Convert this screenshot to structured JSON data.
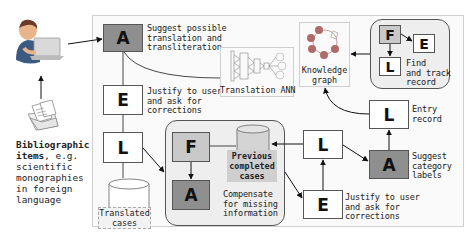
{
  "actor": {
    "icon": "user-with-laptop-icon",
    "documents_icon": "documents-folder-icon",
    "caption_bold": "Bibliographic\nitems",
    "caption_rest": ", e.g.\nscientific\nmonographies\nin foreign\nlanguage"
  },
  "left_column": {
    "node_a": {
      "letter": "A",
      "label": "Suggest possible\ntranslation and\ntransliteration"
    },
    "node_e": {
      "letter": "E",
      "label": "Justify to user\nand ask for\ncorrections"
    },
    "node_l": {
      "letter": "L"
    },
    "database": {
      "label": "Translated\ncases"
    }
  },
  "translation_ann": {
    "icon": "neural-network-icon",
    "label": "Translation ANN"
  },
  "knowledge_graph": {
    "icon": "knowledge-graph-icon",
    "label": "Knowledge\ngraph"
  },
  "find_track": {
    "node_f": {
      "letter": "F"
    },
    "node_e": {
      "letter": "E"
    },
    "node_l": {
      "letter": "L"
    },
    "label": "Find\nand track\nrecord"
  },
  "compensate_group": {
    "node_f": {
      "letter": "F"
    },
    "node_a": {
      "letter": "A"
    },
    "database": {
      "label": "Previous\ncompleted\ncases"
    },
    "label": "Compensate\nfor missing\ninformation"
  },
  "right_column": {
    "entry_l": {
      "letter": "L",
      "label": "Entry\nrecord"
    },
    "suggest_a": {
      "letter": "A",
      "label": "Suggest\ncategory\nlabels"
    },
    "mid_l": {
      "letter": "L"
    },
    "justify_e": {
      "letter": "E",
      "label": "Justify to user\nand ask for\ncorrections"
    }
  },
  "colors": {
    "dark_node": "#8f8f8f",
    "light_node": "#c9c9c9",
    "panel_bg": "#fafafa",
    "group_bg": "#eeeeee",
    "graph_node": "#b06a6a"
  }
}
